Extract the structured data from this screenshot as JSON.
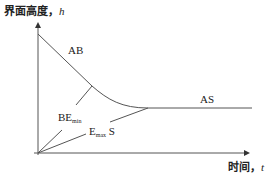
{
  "diagram": {
    "y_axis": {
      "title": "界面高度，",
      "variable": "h"
    },
    "x_axis": {
      "title": "时间，",
      "variable": "t"
    },
    "curves": [
      {
        "id": "AB",
        "label": "AB"
      },
      {
        "id": "AS",
        "label": "AS"
      },
      {
        "id": "BEmin",
        "label_main": "BE",
        "label_sub": "min"
      },
      {
        "id": "EmaxS",
        "label_main": "E",
        "label_sub": "max",
        "label_tail": " S"
      }
    ],
    "colors": {
      "line": "#555555",
      "text": "#222222",
      "background": "#ffffff"
    }
  }
}
